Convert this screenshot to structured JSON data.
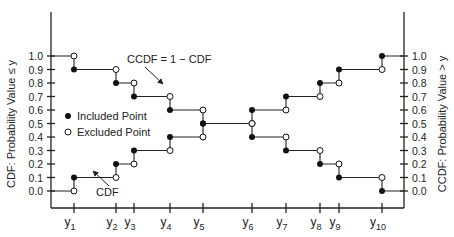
{
  "chart_data": {
    "type": "line",
    "title": "",
    "left_ylabel": "CDF: Probability Value ≤ y",
    "right_ylabel": "CCDF: Probability Value > y",
    "xlabel": "",
    "ylim": [
      0.0,
      1.0
    ],
    "yticks": [
      "0.0",
      "0.1",
      "0.2",
      "0.3",
      "0.4",
      "0.5",
      "0.6",
      "0.7",
      "0.8",
      "0.9",
      "1.0"
    ],
    "x_categories": [
      "y1",
      "y2",
      "y3",
      "y4",
      "y5",
      "y6",
      "y7",
      "y8",
      "y9",
      "y10"
    ],
    "series": [
      {
        "name": "CDF",
        "step_values_after": [
          0.1,
          0.2,
          0.3,
          0.4,
          0.5,
          0.6,
          0.7,
          0.8,
          0.9,
          1.0
        ],
        "step_values_before": [
          0.0,
          0.1,
          0.2,
          0.3,
          0.4,
          0.5,
          0.6,
          0.7,
          0.8,
          0.9
        ]
      },
      {
        "name": "CCDF = 1 − CDF",
        "step_values_after": [
          0.9,
          0.8,
          0.7,
          0.6,
          0.5,
          0.4,
          0.3,
          0.2,
          0.1,
          0.0
        ],
        "step_values_before": [
          1.0,
          0.9,
          0.8,
          0.7,
          0.6,
          0.5,
          0.4,
          0.3,
          0.2,
          0.1
        ]
      }
    ],
    "legend": [
      {
        "marker": "filled-circle",
        "label": "Included Point"
      },
      {
        "marker": "open-circle",
        "label": "Excluded Point"
      }
    ],
    "annotations": [
      {
        "text": "CCDF = 1 − CDF",
        "points_to": "CCDF curve near y4"
      },
      {
        "text": "CDF",
        "points_to": "CDF curve near y2"
      }
    ],
    "grid": false
  },
  "labels": {
    "left_axis": "CDF: Probability Value ≤ y",
    "right_axis": "CCDF: Probability Value > y",
    "ccdf_note": "CCDF = 1 − CDF",
    "cdf_note": "CDF",
    "legend_included": "Included Point",
    "legend_excluded": "Excluded Point"
  }
}
